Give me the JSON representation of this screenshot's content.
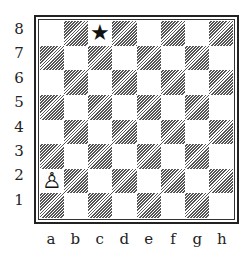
{
  "board": {
    "ranks": [
      "8",
      "7",
      "6",
      "5",
      "4",
      "3",
      "2",
      "1"
    ],
    "files": [
      "a",
      "b",
      "c",
      "d",
      "e",
      "f",
      "g",
      "h"
    ],
    "pieces": [
      {
        "square": "c8",
        "glyph": "★",
        "name": "star-marker"
      },
      {
        "square": "a2",
        "glyph": "♙",
        "name": "white-pawn"
      }
    ]
  }
}
